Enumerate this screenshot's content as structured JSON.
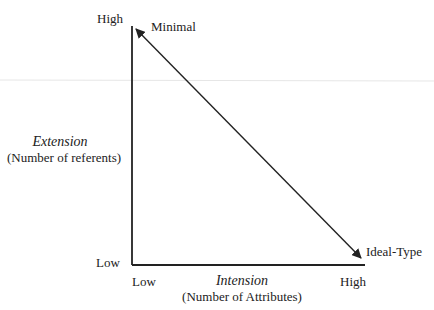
{
  "diagram": {
    "y_axis": {
      "title": "Extension",
      "subtitle": "(Number of referents)",
      "high_label": "High",
      "low_label": "Low"
    },
    "x_axis": {
      "title": "Intension",
      "subtitle": "(Number of Attributes)",
      "low_label": "Low",
      "high_label": "High"
    },
    "endpoints": {
      "top_left": "Minimal",
      "bottom_right": "Ideal-Type"
    },
    "colors": {
      "line": "#222222",
      "faint_rule": "#e4e4e4"
    }
  }
}
